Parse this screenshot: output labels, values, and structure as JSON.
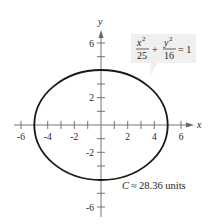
{
  "diagram": {
    "type": "ellipse-graph",
    "equation": {
      "term1_num": "x",
      "term1_exp": "2",
      "term1_den": "25",
      "plus": "+",
      "term2_num": "y",
      "term2_exp": "2",
      "term2_den": "16",
      "equals": "= 1"
    },
    "x_axis_label": "x",
    "y_axis_label": "y",
    "x_tick_labels": [
      "-6",
      "-4",
      "-2",
      "2",
      "4",
      "6"
    ],
    "y_tick_labels": [
      "6",
      "2",
      "-2",
      "-6"
    ],
    "circumference": {
      "var": "C",
      "approx": "≈",
      "value": "28.36 units"
    },
    "semi_major_axis": 5,
    "semi_minor_axis": 4,
    "colors": {
      "curve": "#1a1a1a",
      "axes": "#555555",
      "callout_bg": "#efefef"
    }
  }
}
